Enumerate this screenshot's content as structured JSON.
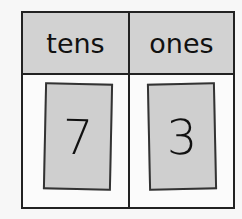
{
  "place_value_chart": {
    "columns": [
      {
        "header": "tens",
        "digit": "7"
      },
      {
        "header": "ones",
        "digit": "3"
      }
    ]
  }
}
